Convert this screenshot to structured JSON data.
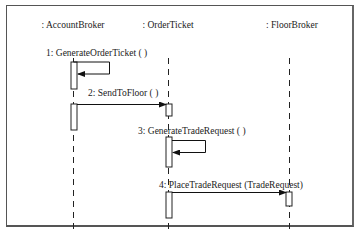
{
  "diagram": {
    "type": "sequence",
    "objects": [
      {
        "id": "accountbroker",
        "label": ": AccountBroker",
        "x": 73
      },
      {
        "id": "orderticket",
        "label": ": OrderTicket",
        "x": 168
      },
      {
        "id": "floorbroker",
        "label": ": FloorBroker",
        "x": 289
      }
    ],
    "messages": [
      {
        "seq": 1,
        "label": "1: GenerateOrderTicket ( )",
        "from": "accountbroker",
        "to": "accountbroker",
        "self": true
      },
      {
        "seq": 2,
        "label": "2: SendToFloor ( )",
        "from": "accountbroker",
        "to": "orderticket",
        "self": false
      },
      {
        "seq": 3,
        "label": "3: GenerateTradeRequest ( )",
        "from": "orderticket",
        "to": "orderticket",
        "self": true
      },
      {
        "seq": 4,
        "label": "4: PlaceTradeRequest (TradeRequest)",
        "from": "orderticket",
        "to": "floorbroker",
        "self": false
      }
    ]
  }
}
